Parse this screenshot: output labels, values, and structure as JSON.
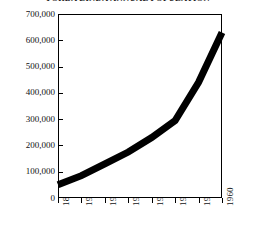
{
  "chart_data": {
    "type": "line",
    "title": "YORBA LINDA ANNUAL POPULATION",
    "xlabel": "",
    "ylabel": "",
    "categories": [
      "1890",
      "1900",
      "1910",
      "1920",
      "1930",
      "1940",
      "1950",
      "1960"
    ],
    "x": [
      1890,
      1900,
      1910,
      1920,
      1930,
      1940,
      1950,
      1960
    ],
    "values": [
      50000,
      85000,
      130000,
      175000,
      230000,
      295000,
      440000,
      630000
    ],
    "series": [
      {
        "name": "Population",
        "values": [
          50000,
          85000,
          130000,
          175000,
          230000,
          295000,
          440000,
          630000
        ]
      }
    ],
    "ylim": [
      0,
      700000
    ],
    "xlim": [
      1890,
      1960
    ],
    "ytick_labels": [
      "700,000",
      "600,000",
      "500,000",
      "400,000",
      "300,000",
      "200,000",
      "100,000",
      "0"
    ],
    "ytick_values": [
      700000,
      600000,
      500000,
      400000,
      300000,
      200000,
      100000,
      0
    ],
    "xtick_labels": [
      "1890",
      "1900",
      "1910",
      "1920",
      "1930",
      "1940",
      "1950",
      "1960"
    ],
    "grid": false,
    "legend": false,
    "line_color": "#000000",
    "background_color": "#ffffff",
    "xtick_rotation": "90"
  }
}
